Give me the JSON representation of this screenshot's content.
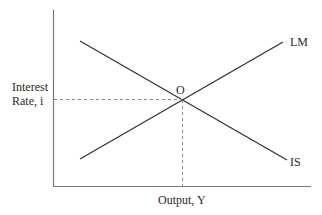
{
  "diagram": {
    "y_axis_label_line1": "Interest",
    "y_axis_label_line2": "Rate, i",
    "x_axis_label": "Output, Y",
    "curves": [
      {
        "name": "LM",
        "label": "LM",
        "slope": "upward"
      },
      {
        "name": "IS",
        "label": "IS",
        "slope": "downward"
      }
    ],
    "equilibrium_label": "O",
    "colors": {
      "line": "#3a3a3a",
      "axis": "#6a6a6a",
      "guide": "#8a8a8a"
    }
  }
}
